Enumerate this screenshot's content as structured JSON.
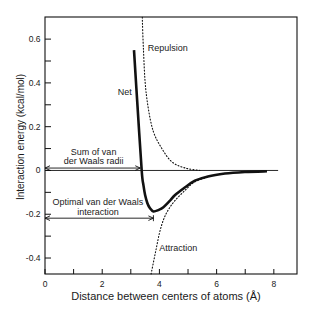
{
  "chart_data": {
    "type": "line",
    "title": "",
    "xlabel": "Distance between centers of atoms (Å)",
    "ylabel": "Interaction energy  (kcal/mol)",
    "xlim": [
      0,
      8.81
    ],
    "ylim": [
      -0.473,
      0.701
    ],
    "grid": false,
    "legend": null,
    "xticks": [
      0,
      1,
      2,
      3,
      4,
      5,
      6,
      7,
      8
    ],
    "xtick_labels": [
      "0",
      "",
      "2",
      "",
      "4",
      "",
      "6",
      "",
      "8"
    ],
    "yticks": [
      0.6,
      0.5,
      0.4,
      0.3,
      0.2,
      0.1,
      0,
      -0.1,
      -0.2,
      -0.3,
      -0.4
    ],
    "ytick_labels": [
      "0.6",
      "",
      "0.4",
      "",
      "0.2",
      "",
      "0",
      "",
      "-0.2",
      "",
      "-0.4"
    ],
    "series": [
      {
        "name": "Net",
        "style": "solid",
        "x": [
          3.11,
          3.24,
          3.38,
          3.44,
          3.5,
          3.58,
          3.67,
          3.79,
          3.96,
          4.14,
          4.37,
          4.55,
          4.9,
          5.24,
          5.7,
          6.29,
          6.99,
          7.76
        ],
        "y": [
          0.55,
          0.28,
          0.0,
          -0.066,
          -0.112,
          -0.15,
          -0.173,
          -0.187,
          -0.181,
          -0.168,
          -0.138,
          -0.112,
          -0.077,
          -0.047,
          -0.027,
          -0.014,
          -0.007,
          -0.004
        ]
      },
      {
        "name": "Repulsion",
        "style": "dotted",
        "x": [
          3.4,
          3.44,
          3.5,
          3.61,
          3.79,
          4.08,
          4.43,
          4.9,
          5.42
        ],
        "y": [
          0.7,
          0.558,
          0.405,
          0.284,
          0.177,
          0.101,
          0.04,
          0.011,
          0.0
        ]
      },
      {
        "name": "Attraction",
        "style": "dotted",
        "x": [
          3.71,
          3.76,
          3.88,
          4.0,
          4.14,
          4.31,
          4.55,
          4.9,
          5.24,
          5.7
        ],
        "y": [
          -0.473,
          -0.439,
          -0.363,
          -0.287,
          -0.226,
          -0.18,
          -0.137,
          -0.09,
          -0.052,
          -0.03
        ]
      }
    ],
    "reference_line": {
      "y": 0,
      "x_from": 0,
      "x_to": 8.15
    },
    "annotations": [
      {
        "text": "Net",
        "x": 3.03,
        "y": 0.36,
        "anchor": "end"
      },
      {
        "text": "Repulsion",
        "x": 3.59,
        "y": 0.56,
        "anchor": "start"
      },
      {
        "text": "Attraction",
        "x": 3.99,
        "y": -0.354,
        "anchor": "start"
      }
    ],
    "arrows": [
      {
        "lines": [
          "Sum of van",
          "der Waals radii"
        ],
        "label_x": 1.7,
        "label_y": [
          0.084,
          0.043
        ],
        "y": 0.011,
        "x_from": 0,
        "x_to": 3.33,
        "end_bar": false
      },
      {
        "lines": [
          "Optimal van der Waals",
          "interaction"
        ],
        "label_x": 1.85,
        "label_y": [
          -0.144,
          -0.19
        ],
        "y": -0.218,
        "x_from": 0,
        "x_to": 3.79,
        "end_bar": true
      }
    ]
  }
}
